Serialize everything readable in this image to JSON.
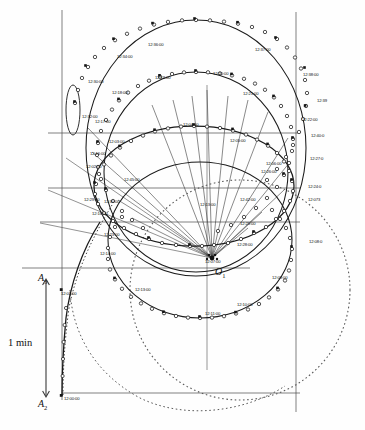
{
  "figure": {
    "type": "trajectory-diagram",
    "center_label": "O",
    "center_sub": "1",
    "axis_labels": [
      {
        "name": "A",
        "sub": "3"
      },
      {
        "name": "A",
        "sub": "2"
      }
    ],
    "scale_bar": {
      "label": "1 min"
    },
    "colors": {
      "curve": "#1a1a1a",
      "grid": "#4a4a4a",
      "dashed": "#555555",
      "marker_fill": "#ffffff",
      "marker_stroke": "#1a1a1a",
      "text": "#101010",
      "background": "#ffffff"
    }
  },
  "time_labels": [
    {
      "text": "12:36:00",
      "x": 148,
      "y": 43
    },
    {
      "text": "12:34:00",
      "x": 117,
      "y": 55
    },
    {
      "text": "12:37:00",
      "x": 255,
      "y": 48
    },
    {
      "text": "12:30:00",
      "x": 88,
      "y": 80
    },
    {
      "text": "12:38:00",
      "x": 303,
      "y": 73
    },
    {
      "text": "12:19:00",
      "x": 155,
      "y": 76
    },
    {
      "text": "12:20:00",
      "x": 213,
      "y": 72
    },
    {
      "text": "12:18:00",
      "x": 112,
      "y": 91
    },
    {
      "text": "12:21:00",
      "x": 243,
      "y": 92
    },
    {
      "text": "12:32:00",
      "x": 82,
      "y": 115
    },
    {
      "text": "12:39",
      "x": 317,
      "y": 99
    },
    {
      "text": "12:17:00",
      "x": 95,
      "y": 120
    },
    {
      "text": "12:04:00",
      "x": 183,
      "y": 123
    },
    {
      "text": "12:22:00",
      "x": 302,
      "y": 118
    },
    {
      "text": "12:03:00",
      "x": 109,
      "y": 140
    },
    {
      "text": "12:40:0",
      "x": 311,
      "y": 134
    },
    {
      "text": "12:05:00",
      "x": 230,
      "y": 139
    },
    {
      "text": "12:16:00",
      "x": 90,
      "y": 152
    },
    {
      "text": "12:27:0",
      "x": 310,
      "y": 157
    },
    {
      "text": "12:06:00",
      "x": 266,
      "y": 162
    },
    {
      "text": "12:02:00",
      "x": 86,
      "y": 165
    },
    {
      "text": "12:26:00",
      "x": 261,
      "y": 170
    },
    {
      "text": "12:45:00",
      "x": 124,
      "y": 178
    },
    {
      "text": "12:24:0",
      "x": 308,
      "y": 185
    },
    {
      "text": "12:42:00",
      "x": 240,
      "y": 198
    },
    {
      "text": "12:13:00",
      "x": 200,
      "y": 203
    },
    {
      "text": "12:073",
      "x": 308,
      "y": 198
    },
    {
      "text": "12:30:00",
      "x": 104,
      "y": 200
    },
    {
      "text": "12:29:00",
      "x": 84,
      "y": 198
    },
    {
      "text": "12:25:00",
      "x": 240,
      "y": 222
    },
    {
      "text": "12:16:00",
      "x": 92,
      "y": 212
    },
    {
      "text": "12:08:0",
      "x": 309,
      "y": 240
    },
    {
      "text": "12:28:00",
      "x": 237,
      "y": 243
    },
    {
      "text": "12:23:00",
      "x": 104,
      "y": 233
    },
    {
      "text": "12:14:00",
      "x": 100,
      "y": 252
    },
    {
      "text": "12:07:00",
      "x": 205,
      "y": 260
    },
    {
      "text": "12:09:00",
      "x": 272,
      "y": 276
    },
    {
      "text": "12:01:00",
      "x": 61,
      "y": 292
    },
    {
      "text": "12:13:00",
      "x": 135,
      "y": 288
    },
    {
      "text": "12:10:00",
      "x": 237,
      "y": 303
    },
    {
      "text": "12:11:00",
      "x": 205,
      "y": 312
    },
    {
      "text": "12:00:00",
      "x": 64,
      "y": 397
    }
  ]
}
